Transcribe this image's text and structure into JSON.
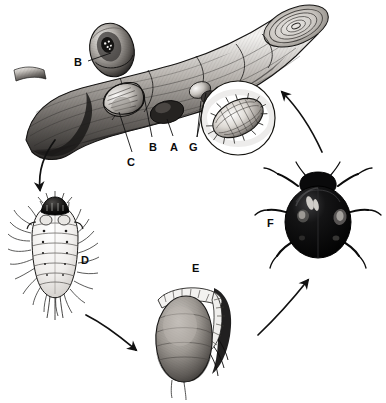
{
  "figure": {
    "background_color": "#ffffff",
    "ink_color": "#111111",
    "width": 386,
    "height": 403,
    "style": "grayscale scientific line-and-wash illustration"
  },
  "labels": [
    {
      "id": "B1",
      "text": "B",
      "x": 74,
      "y": 57,
      "describes": "scale insect cover on branch (upper)"
    },
    {
      "id": "C",
      "text": "C",
      "x": 127,
      "y": 157,
      "describes": "scale insect body beneath cover"
    },
    {
      "id": "B2",
      "text": "B",
      "x": 149,
      "y": 142,
      "describes": "scale insect cover on branch (lower)"
    },
    {
      "id": "A",
      "text": "A",
      "x": 170,
      "y": 142,
      "describes": "scale insect on bark"
    },
    {
      "id": "G",
      "text": "G",
      "x": 189,
      "y": 142,
      "describes": "enlarged scale insect in circular inset"
    },
    {
      "id": "D",
      "text": "D",
      "x": 81,
      "y": 255,
      "describes": "beetle larva"
    },
    {
      "id": "E",
      "text": "E",
      "x": 192,
      "y": 263,
      "describes": "beetle pupa"
    },
    {
      "id": "F",
      "text": "F",
      "x": 267,
      "y": 218,
      "describes": "adult ladybird beetle"
    }
  ],
  "stages": [
    {
      "key": "branch",
      "name": "Infested branch with scale insects",
      "labels": [
        "A",
        "B",
        "C"
      ]
    },
    {
      "key": "inset",
      "name": "Circular magnified inset of scale insect",
      "labels": [
        "G"
      ]
    },
    {
      "key": "larva",
      "name": "Larva",
      "labels": [
        "D"
      ]
    },
    {
      "key": "pupa",
      "name": "Pupa",
      "labels": [
        "E"
      ]
    },
    {
      "key": "adult",
      "name": "Adult beetle",
      "labels": [
        "F"
      ]
    }
  ],
  "arrows": [
    {
      "from": "branch",
      "to": "larva",
      "direction": "down-left"
    },
    {
      "from": "larva",
      "to": "pupa",
      "direction": "right-down"
    },
    {
      "from": "pupa",
      "to": "adult",
      "direction": "up-right"
    },
    {
      "from": "adult",
      "to": "branch",
      "direction": "up-left"
    }
  ],
  "leader_lines": [
    {
      "label": "B1",
      "from": [
        88,
        62
      ],
      "to": [
        112,
        54
      ]
    },
    {
      "label": "C",
      "from": [
        133,
        152
      ],
      "to": [
        119,
        111
      ]
    },
    {
      "label": "B2",
      "from": [
        152,
        137
      ],
      "to": [
        145,
        95
      ]
    },
    {
      "label": "A",
      "from": [
        173,
        137
      ],
      "to": [
        167,
        118
      ]
    },
    {
      "label": "G",
      "from": [
        196,
        138
      ],
      "to": [
        205,
        92
      ]
    },
    {
      "label": "G",
      "from": [
        196,
        138
      ],
      "to": [
        201,
        101
      ]
    }
  ]
}
